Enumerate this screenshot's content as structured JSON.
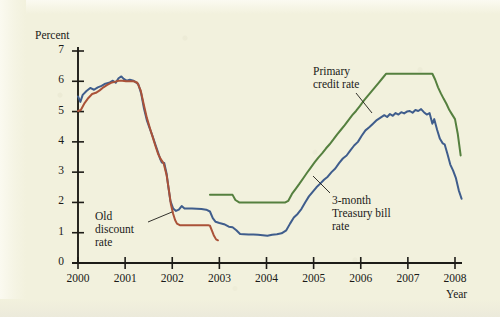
{
  "figure": {
    "background_color": "#f2f1dd",
    "axis_color": "#1d1c17"
  },
  "axes": {
    "y_label": "Percent",
    "x_label": "Year",
    "y_ticks": [
      "0",
      "1",
      "2",
      "3",
      "4",
      "5",
      "6",
      "7"
    ],
    "x_ticks": [
      "2000",
      "2001",
      "2002",
      "2003",
      "2004",
      "2005",
      "2006",
      "2007",
      "2008"
    ]
  },
  "annotations": [
    {
      "name": "primary-credit-rate",
      "lines": [
        "Primary",
        "credit rate"
      ]
    },
    {
      "name": "old-discount-rate",
      "lines": [
        "Old",
        "discount",
        "rate"
      ]
    },
    {
      "name": "three-month-treasury-bill-rate",
      "lines": [
        "3-month",
        "Treasury bill",
        "rate"
      ]
    }
  ],
  "chart_data": {
    "type": "line",
    "title": "",
    "xlabel": "Year",
    "ylabel": "Percent",
    "xlim": [
      2000,
      2008.35
    ],
    "ylim": [
      0,
      7.45
    ],
    "grid": false,
    "legend": "inline-annotations",
    "series": [
      {
        "name": "3-month Treasury bill rate",
        "color": "#3f5d8c",
        "points": [
          [
            2000.0,
            5.5
          ],
          [
            2000.05,
            5.32
          ],
          [
            2000.1,
            5.55
          ],
          [
            2000.18,
            5.68
          ],
          [
            2000.26,
            5.78
          ],
          [
            2000.34,
            5.72
          ],
          [
            2000.42,
            5.8
          ],
          [
            2000.5,
            5.85
          ],
          [
            2000.58,
            5.92
          ],
          [
            2000.66,
            5.95
          ],
          [
            2000.74,
            6.02
          ],
          [
            2000.8,
            5.95
          ],
          [
            2000.86,
            6.1
          ],
          [
            2000.92,
            6.16
          ],
          [
            2000.97,
            6.08
          ],
          [
            2001.03,
            6.02
          ],
          [
            2001.1,
            6.05
          ],
          [
            2001.16,
            6.03
          ],
          [
            2001.22,
            5.98
          ],
          [
            2001.28,
            5.9
          ],
          [
            2001.34,
            5.6
          ],
          [
            2001.4,
            5.1
          ],
          [
            2001.46,
            4.72
          ],
          [
            2001.52,
            4.45
          ],
          [
            2001.58,
            4.2
          ],
          [
            2001.64,
            3.92
          ],
          [
            2001.7,
            3.65
          ],
          [
            2001.74,
            3.45
          ],
          [
            2001.78,
            3.32
          ],
          [
            2001.83,
            3.3
          ],
          [
            2001.88,
            2.95
          ],
          [
            2001.92,
            2.48
          ],
          [
            2001.96,
            2.05
          ],
          [
            2002.02,
            1.8
          ],
          [
            2002.08,
            1.72
          ],
          [
            2002.14,
            1.76
          ],
          [
            2002.2,
            1.88
          ],
          [
            2002.26,
            1.8
          ],
          [
            2002.33,
            1.8
          ],
          [
            2002.42,
            1.8
          ],
          [
            2002.52,
            1.79
          ],
          [
            2002.62,
            1.78
          ],
          [
            2002.72,
            1.76
          ],
          [
            2002.8,
            1.7
          ],
          [
            2002.86,
            1.48
          ],
          [
            2002.92,
            1.36
          ],
          [
            2003.0,
            1.32
          ],
          [
            2003.1,
            1.28
          ],
          [
            2003.2,
            1.2
          ],
          [
            2003.28,
            1.18
          ],
          [
            2003.36,
            1.08
          ],
          [
            2003.44,
            0.96
          ],
          [
            2003.52,
            0.95
          ],
          [
            2003.62,
            0.94
          ],
          [
            2003.72,
            0.94
          ],
          [
            2003.82,
            0.93
          ],
          [
            2003.92,
            0.92
          ],
          [
            2004.02,
            0.9
          ],
          [
            2004.12,
            0.93
          ],
          [
            2004.22,
            0.95
          ],
          [
            2004.32,
            0.98
          ],
          [
            2004.42,
            1.08
          ],
          [
            2004.5,
            1.3
          ],
          [
            2004.58,
            1.5
          ],
          [
            2004.66,
            1.62
          ],
          [
            2004.74,
            1.78
          ],
          [
            2004.82,
            2.0
          ],
          [
            2004.9,
            2.2
          ],
          [
            2004.98,
            2.35
          ],
          [
            2005.06,
            2.5
          ],
          [
            2005.14,
            2.62
          ],
          [
            2005.22,
            2.75
          ],
          [
            2005.3,
            2.85
          ],
          [
            2005.38,
            3.0
          ],
          [
            2005.46,
            3.12
          ],
          [
            2005.54,
            3.3
          ],
          [
            2005.62,
            3.45
          ],
          [
            2005.7,
            3.55
          ],
          [
            2005.78,
            3.72
          ],
          [
            2005.86,
            3.88
          ],
          [
            2005.94,
            4.0
          ],
          [
            2006.02,
            4.2
          ],
          [
            2006.1,
            4.38
          ],
          [
            2006.18,
            4.48
          ],
          [
            2006.26,
            4.6
          ],
          [
            2006.34,
            4.72
          ],
          [
            2006.42,
            4.8
          ],
          [
            2006.5,
            4.88
          ],
          [
            2006.56,
            4.82
          ],
          [
            2006.62,
            4.92
          ],
          [
            2006.68,
            4.86
          ],
          [
            2006.74,
            4.95
          ],
          [
            2006.8,
            4.9
          ],
          [
            2006.86,
            4.98
          ],
          [
            2006.92,
            4.94
          ],
          [
            2006.98,
            5.0
          ],
          [
            2007.04,
            5.02
          ],
          [
            2007.1,
            4.96
          ],
          [
            2007.16,
            5.05
          ],
          [
            2007.22,
            5.02
          ],
          [
            2007.28,
            5.08
          ],
          [
            2007.34,
            4.98
          ],
          [
            2007.4,
            4.9
          ],
          [
            2007.46,
            4.95
          ],
          [
            2007.52,
            4.6
          ],
          [
            2007.56,
            4.75
          ],
          [
            2007.62,
            4.4
          ],
          [
            2007.68,
            4.1
          ],
          [
            2007.74,
            3.95
          ],
          [
            2007.78,
            3.92
          ],
          [
            2007.84,
            3.6
          ],
          [
            2007.9,
            3.25
          ],
          [
            2007.96,
            3.05
          ],
          [
            2008.02,
            2.8
          ],
          [
            2008.08,
            2.4
          ],
          [
            2008.14,
            2.12
          ]
        ]
      },
      {
        "name": "Old discount rate",
        "color": "#aa5238",
        "points": [
          [
            2000.0,
            5.02
          ],
          [
            2000.06,
            5.05
          ],
          [
            2000.14,
            5.28
          ],
          [
            2000.22,
            5.45
          ],
          [
            2000.3,
            5.58
          ],
          [
            2000.38,
            5.62
          ],
          [
            2000.46,
            5.7
          ],
          [
            2000.54,
            5.8
          ],
          [
            2000.62,
            5.88
          ],
          [
            2000.7,
            5.95
          ],
          [
            2000.78,
            5.98
          ],
          [
            2000.86,
            6.02
          ],
          [
            2000.94,
            6.02
          ],
          [
            2001.02,
            6.0
          ],
          [
            2001.1,
            6.0
          ],
          [
            2001.18,
            6.0
          ],
          [
            2001.26,
            5.95
          ],
          [
            2001.33,
            5.7
          ],
          [
            2001.4,
            5.2
          ],
          [
            2001.46,
            4.8
          ],
          [
            2001.52,
            4.48
          ],
          [
            2001.58,
            4.18
          ],
          [
            2001.64,
            3.88
          ],
          [
            2001.7,
            3.6
          ],
          [
            2001.76,
            3.42
          ],
          [
            2001.82,
            3.28
          ],
          [
            2001.88,
            2.9
          ],
          [
            2001.93,
            2.4
          ],
          [
            2001.97,
            1.95
          ],
          [
            2002.02,
            1.62
          ],
          [
            2002.06,
            1.42
          ],
          [
            2002.1,
            1.3
          ],
          [
            2002.16,
            1.25
          ],
          [
            2002.26,
            1.25
          ],
          [
            2002.4,
            1.25
          ],
          [
            2002.55,
            1.25
          ],
          [
            2002.68,
            1.25
          ],
          [
            2002.76,
            1.25
          ],
          [
            2002.8,
            1.23
          ],
          [
            2002.84,
            1.08
          ],
          [
            2002.88,
            0.92
          ],
          [
            2002.93,
            0.78
          ],
          [
            2002.97,
            0.75
          ]
        ]
      },
      {
        "name": "Primary credit rate",
        "color": "#55803f",
        "points": [
          [
            2002.8,
            2.25
          ],
          [
            2003.0,
            2.25
          ],
          [
            2003.18,
            2.25
          ],
          [
            2003.28,
            2.25
          ],
          [
            2003.34,
            2.08
          ],
          [
            2003.42,
            2.0
          ],
          [
            2003.6,
            2.0
          ],
          [
            2003.8,
            2.0
          ],
          [
            2004.0,
            2.0
          ],
          [
            2004.2,
            2.0
          ],
          [
            2004.4,
            2.0
          ],
          [
            2004.46,
            2.05
          ],
          [
            2004.54,
            2.28
          ],
          [
            2004.62,
            2.45
          ],
          [
            2004.7,
            2.62
          ],
          [
            2004.78,
            2.8
          ],
          [
            2004.86,
            2.98
          ],
          [
            2004.94,
            3.15
          ],
          [
            2005.02,
            3.32
          ],
          [
            2005.1,
            3.48
          ],
          [
            2005.18,
            3.62
          ],
          [
            2005.26,
            3.78
          ],
          [
            2005.34,
            3.92
          ],
          [
            2005.42,
            4.08
          ],
          [
            2005.5,
            4.25
          ],
          [
            2005.58,
            4.4
          ],
          [
            2005.66,
            4.55
          ],
          [
            2005.74,
            4.72
          ],
          [
            2005.82,
            4.88
          ],
          [
            2005.9,
            5.02
          ],
          [
            2005.98,
            5.18
          ],
          [
            2006.06,
            5.35
          ],
          [
            2006.14,
            5.5
          ],
          [
            2006.22,
            5.65
          ],
          [
            2006.3,
            5.8
          ],
          [
            2006.38,
            5.95
          ],
          [
            2006.46,
            6.1
          ],
          [
            2006.54,
            6.25
          ],
          [
            2006.62,
            6.25
          ],
          [
            2006.8,
            6.25
          ],
          [
            2007.0,
            6.25
          ],
          [
            2007.2,
            6.25
          ],
          [
            2007.4,
            6.25
          ],
          [
            2007.52,
            6.25
          ],
          [
            2007.58,
            6.05
          ],
          [
            2007.64,
            5.8
          ],
          [
            2007.7,
            5.6
          ],
          [
            2007.76,
            5.42
          ],
          [
            2007.82,
            5.25
          ],
          [
            2007.88,
            5.05
          ],
          [
            2007.94,
            4.9
          ],
          [
            2008.0,
            4.75
          ],
          [
            2008.06,
            4.25
          ],
          [
            2008.12,
            3.55
          ]
        ]
      }
    ]
  }
}
